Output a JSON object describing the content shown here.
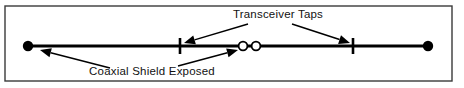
{
  "figure": {
    "name": "ethernet-coaxial-cable-diagram",
    "background_color": "#ffffff",
    "line_color": "#000000",
    "border": {
      "color": "#3a3a3a",
      "x": 5,
      "y": 6,
      "width": 447,
      "height": 75,
      "stroke_width": 1.4
    }
  },
  "labels": {
    "transceiver_taps": {
      "text": "Transceiver Taps",
      "x": 278,
      "y": 18,
      "anchor": "middle"
    },
    "coaxial_shield_exposed": {
      "text": "Coaxial Shield Exposed",
      "x": 152,
      "y": 75,
      "anchor": "middle"
    }
  },
  "cable": {
    "name": "coaxial-cable-segment",
    "x1": 28,
    "x2": 428,
    "y": 46,
    "stroke_width": 3.2
  },
  "terminators": [
    {
      "name": "terminator-left",
      "cx": 28,
      "cy": 46,
      "r": 5.2,
      "fill": "#000000"
    },
    {
      "name": "terminator-right",
      "cx": 428,
      "cy": 46,
      "r": 5.2,
      "fill": "#000000"
    }
  ],
  "taps": [
    {
      "name": "transceiver-tap-1",
      "x": 180,
      "y1": 38,
      "y2": 54,
      "stroke_width": 2.6
    },
    {
      "name": "transceiver-tap-2",
      "x": 353,
      "y1": 38,
      "y2": 54,
      "stroke_width": 2.6
    }
  ],
  "shield_exposed_markers": [
    {
      "name": "shield-marker-1",
      "cx": 243,
      "cy": 46,
      "r": 4.4,
      "fill": "#ffffff"
    },
    {
      "name": "shield-marker-2",
      "cx": 256,
      "cy": 46,
      "r": 4.4,
      "fill": "#ffffff"
    }
  ],
  "leaders": [
    {
      "name": "leader-transceiver-taps-left",
      "from_x": 248,
      "from_y": 24,
      "to_x": 184,
      "to_y": 43,
      "arrow": "end"
    },
    {
      "name": "leader-transceiver-taps-right",
      "from_x": 292,
      "from_y": 24,
      "to_x": 350,
      "to_y": 43,
      "arrow": "end"
    },
    {
      "name": "leader-coaxial-shield-left",
      "from_x": 110,
      "from_y": 68,
      "to_x": 40,
      "to_y": 50,
      "arrow": "end"
    },
    {
      "name": "leader-coaxial-shield-right",
      "from_x": 178,
      "from_y": 66,
      "to_x": 238,
      "to_y": 50,
      "arrow": "end"
    }
  ]
}
